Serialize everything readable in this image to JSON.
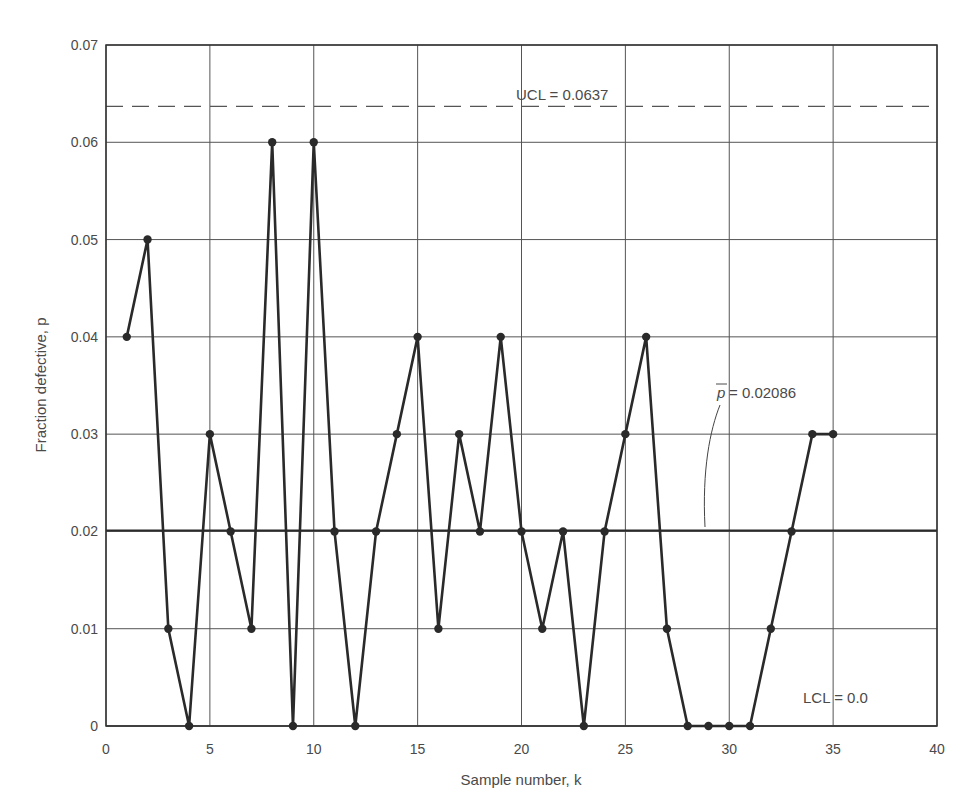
{
  "chart_data": {
    "type": "line",
    "title": "",
    "xlabel": "Sample number, k",
    "ylabel": "Fraction defective, p",
    "xlim": [
      0,
      40
    ],
    "ylim": [
      0,
      0.07
    ],
    "x_ticks": [
      0,
      5,
      10,
      15,
      20,
      25,
      30,
      35,
      40
    ],
    "y_ticks": [
      0,
      0.01,
      0.02,
      0.03,
      0.04,
      0.05,
      0.06,
      0.07
    ],
    "x_tick_labels": [
      "0",
      "5",
      "10",
      "15",
      "20",
      "25",
      "30",
      "35",
      "40"
    ],
    "y_tick_labels": [
      "0",
      "0.01",
      "0.02",
      "0.03",
      "0.04",
      "0.05",
      "0.06",
      "0.07"
    ],
    "grid": true,
    "legend": null,
    "series": [
      {
        "name": "Fraction defective",
        "x": [
          1,
          2,
          3,
          4,
          5,
          6,
          7,
          8,
          9,
          10,
          11,
          12,
          13,
          14,
          15,
          16,
          17,
          18,
          19,
          20,
          21,
          22,
          23,
          24,
          25,
          26,
          27,
          28,
          29,
          30,
          31,
          32,
          33,
          34,
          35
        ],
        "values": [
          0.04,
          0.05,
          0.01,
          0,
          0.03,
          0.02,
          0.01,
          0.06,
          0,
          0.06,
          0.02,
          0,
          0.02,
          0.03,
          0.04,
          0.01,
          0.03,
          0.02,
          0.04,
          0.02,
          0.01,
          0.02,
          0,
          0.02,
          0.03,
          0.04,
          0.01,
          0,
          0,
          0,
          0,
          0.01,
          0.02,
          0.03,
          0.03
        ]
      }
    ],
    "reference_lines": [
      {
        "name": "UCL",
        "value": 0.0637,
        "style": "dashed",
        "label": "UCL = 0.0637"
      },
      {
        "name": "center",
        "value": 0.02086,
        "style": "solid",
        "label_symbol": "p",
        "label_value": "= 0.02086"
      },
      {
        "name": "LCL",
        "value": 0.0,
        "style": "solid",
        "label": "LCL = 0.0"
      }
    ],
    "colors": {
      "line": "#2a2a2a",
      "grid": "#555555",
      "text": "#4a4a4a"
    }
  }
}
